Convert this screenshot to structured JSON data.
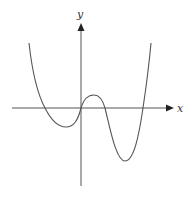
{
  "figure": {
    "x_axis_label": "x",
    "y_axis_label": "y",
    "colors": {
      "curve": "#555555",
      "axis": "#555555",
      "background": "#ffffff"
    },
    "origin_px": [
      81,
      108
    ],
    "curve_key_points_px": {
      "left_start": [
        29,
        43
      ],
      "left_root": [
        45,
        108
      ],
      "left_min": [
        66,
        127
      ],
      "origin_root": [
        81,
        108
      ],
      "local_max": [
        94,
        95
      ],
      "middle_root": [
        105,
        108
      ],
      "right_min": [
        125,
        161
      ],
      "right_root": [
        143,
        108
      ],
      "right_end": [
        151,
        43
      ]
    }
  }
}
